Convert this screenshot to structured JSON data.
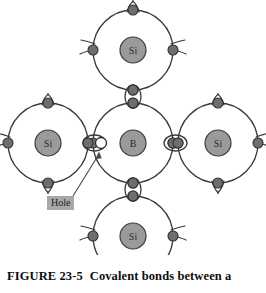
{
  "figure": {
    "caption_label": "FIGURE 23-5",
    "caption_text": "Covalent bonds between a",
    "background_color": "#ffffff",
    "line_color": "#3a3a3a",
    "nucleus_fill": "#9a9a9a",
    "electron_fill": "#6e6e6e",
    "hole_fill": "#ffffff",
    "label_box_fill": "#a8a8a8"
  },
  "annotations": {
    "hole_label": "Hole"
  },
  "diagram": {
    "type": "atomic-bonding-lattice",
    "atoms": [
      {
        "id": "center",
        "symbol": "B",
        "cx": 133,
        "cy": 143,
        "shell_r": 40,
        "nucleus_r": 13
      },
      {
        "id": "top",
        "symbol": "Si",
        "cx": 133,
        "cy": 50,
        "shell_r": 40,
        "nucleus_r": 13
      },
      {
        "id": "left",
        "symbol": "Si",
        "cx": 48,
        "cy": 143,
        "shell_r": 40,
        "nucleus_r": 13
      },
      {
        "id": "right",
        "symbol": "Si",
        "cx": 218,
        "cy": 143,
        "shell_r": 40,
        "nucleus_r": 13
      },
      {
        "id": "bottom",
        "symbol": "Si",
        "cx": 133,
        "cy": 236,
        "shell_r": 40,
        "nucleus_r": 13
      }
    ],
    "bonds": [
      {
        "id": "top-center",
        "orientation": "vertical",
        "cx": 133,
        "cy": 96.5,
        "electrons": 2,
        "hole": false
      },
      {
        "id": "center-bottom",
        "orientation": "vertical",
        "cx": 133,
        "cy": 189.5,
        "electrons": 2,
        "hole": false
      },
      {
        "id": "center-right",
        "orientation": "horizontal",
        "cx": 175.5,
        "cy": 143,
        "electrons": 2,
        "hole": false
      },
      {
        "id": "left-center",
        "orientation": "horizontal",
        "cx": 90.5,
        "cy": 143,
        "electrons": 1,
        "hole": true
      }
    ],
    "hole": {
      "cx": 101,
      "cy": 143,
      "r": 5.5,
      "label": "Hole"
    }
  }
}
